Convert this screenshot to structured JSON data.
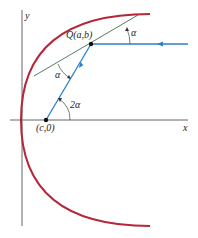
{
  "figure": {
    "axes": {
      "x_label": "x",
      "y_label": "y"
    },
    "labels": {
      "point_q": "Q(a,b)",
      "focus": "(c,0)",
      "alpha_top": "α",
      "alpha_left": "α",
      "two_alpha": "2α"
    },
    "colors": {
      "parabola": "#b5263a",
      "ray": "#2f7fc8",
      "tangent": "#2a5a3a",
      "axis": "#555555",
      "point": "#111111"
    }
  }
}
